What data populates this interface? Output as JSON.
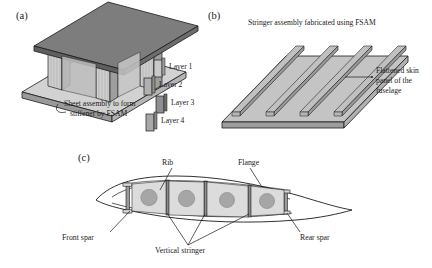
{
  "figure": {
    "panels": [
      {
        "id": "a",
        "letter": "(a)",
        "caption_line1": "Sheet assembly to form",
        "caption_line2": "stiffener by FSAM",
        "legend": [
          {
            "label": "Layer 1",
            "color": "#c9c9c9"
          },
          {
            "label": "Layer 2",
            "color": "#b0b0b0"
          },
          {
            "label": "Layer 3",
            "color": "#8f8f8f"
          },
          {
            "label": "Layer 4",
            "color": "#a8a8a8"
          }
        ]
      },
      {
        "id": "b",
        "letter": "(b)",
        "title": "Stringer assembly fabricated using FSAM",
        "annotation_line1": "Flattened skin",
        "annotation_line2": "panel of the",
        "annotation_line3": "fuselage",
        "stringer_count": 4
      },
      {
        "id": "c",
        "letter": "(c)",
        "labels": {
          "rib": "Rib",
          "flange": "Flange",
          "front_spar": "Front spar",
          "rear_spar": "Rear spar",
          "vertical_stringer": "Vertical stringer"
        },
        "lightening_holes": 4,
        "bay_count": 4
      }
    ],
    "colors": {
      "outline": "#1a1a1a",
      "face_light": "#d2d2d2",
      "face_mid": "#a9a9a9",
      "face_dark": "#7d7d7d",
      "face_top": "#9a9a9a",
      "hole_fill": "#a6a6a6",
      "web_fill": "#8c8c8c"
    }
  }
}
